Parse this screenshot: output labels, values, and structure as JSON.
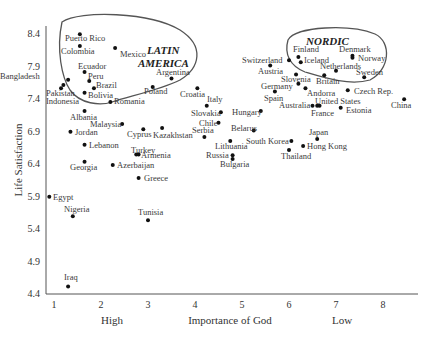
{
  "chart_data": {
    "type": "scatter",
    "title": "",
    "xlabel": "Importance of God",
    "ylabel": "Life Satisfaction",
    "x_end_labels": {
      "low_end": "High",
      "high_end": "Low"
    },
    "xlim": [
      0.9,
      8.6
    ],
    "ylim": [
      4.4,
      8.5
    ],
    "x_ticks": [
      1,
      2,
      3,
      4,
      5,
      6,
      7,
      8
    ],
    "y_ticks": [
      8.4,
      7.9,
      7.4,
      6.9,
      6.4,
      5.9,
      5.4,
      4.9,
      4.4
    ],
    "grid": false,
    "legend": null,
    "annotations": [
      {
        "text": "LATIN AMERICA",
        "type": "region-outline",
        "members": [
          "Puerto Rico",
          "Colombia",
          "Mexico",
          "Ecuador",
          "Peru",
          "Brazil",
          "Bolivia",
          "Argentina"
        ]
      },
      {
        "text": "NORDIC",
        "type": "region-outline",
        "members": [
          "Finland",
          "Iceland",
          "Denmark",
          "Norway",
          "Netherlands",
          "Sweden"
        ]
      }
    ],
    "points": [
      {
        "label": "Puerto Rico",
        "x": 1.55,
        "y": 8.38
      },
      {
        "label": "Colombia",
        "x": 1.55,
        "y": 8.2
      },
      {
        "label": "Mexico",
        "x": 2.3,
        "y": 8.17
      },
      {
        "label": "Ecuador",
        "x": 1.65,
        "y": 7.8
      },
      {
        "label": "Peru",
        "x": 1.75,
        "y": 7.66
      },
      {
        "label": "Brazil",
        "x": 1.85,
        "y": 7.55
      },
      {
        "label": "Bolivia",
        "x": 1.65,
        "y": 7.48
      },
      {
        "label": "Argentina",
        "x": 3.5,
        "y": 7.7
      },
      {
        "label": "Bangladesh",
        "x": 1.3,
        "y": 7.68
      },
      {
        "label": "Pakistan",
        "x": 1.15,
        "y": 7.55
      },
      {
        "label": "Indonesia",
        "x": 1.2,
        "y": 7.6
      },
      {
        "label": "Romania",
        "x": 2.2,
        "y": 7.34
      },
      {
        "label": "Poland",
        "x": 3.1,
        "y": 7.57
      },
      {
        "label": "Croatia",
        "x": 4.05,
        "y": 7.55
      },
      {
        "label": "Italy",
        "x": 4.25,
        "y": 7.28
      },
      {
        "label": "Albania",
        "x": 1.65,
        "y": 7.2
      },
      {
        "label": "Malaysia",
        "x": 2.45,
        "y": 7.0
      },
      {
        "label": "Jordan",
        "x": 1.35,
        "y": 6.88
      },
      {
        "label": "Cyprus",
        "x": 2.9,
        "y": 6.92
      },
      {
        "label": "Kazakhstan",
        "x": 3.3,
        "y": 6.94
      },
      {
        "label": "Lebanon",
        "x": 1.65,
        "y": 6.68
      },
      {
        "label": "Turkey",
        "x": 2.75,
        "y": 6.53
      },
      {
        "label": "Armenia",
        "x": 2.8,
        "y": 6.53
      },
      {
        "label": "Georgia",
        "x": 1.65,
        "y": 6.42
      },
      {
        "label": "Azerbaijan",
        "x": 2.25,
        "y": 6.37
      },
      {
        "label": "Greece",
        "x": 2.8,
        "y": 6.17
      },
      {
        "label": "Egypt",
        "x": 0.9,
        "y": 5.88
      },
      {
        "label": "Nigeria",
        "x": 1.4,
        "y": 5.58
      },
      {
        "label": "Tunisia",
        "x": 3.0,
        "y": 5.52
      },
      {
        "label": "Iraq",
        "x": 1.3,
        "y": 4.5
      },
      {
        "label": "Slovakia",
        "x": 4.55,
        "y": 7.18
      },
      {
        "label": "Hungary",
        "x": 5.4,
        "y": 7.2
      },
      {
        "label": "Chile",
        "x": 4.5,
        "y": 7.02
      },
      {
        "label": "Serbia",
        "x": 4.2,
        "y": 6.8
      },
      {
        "label": "Belarus",
        "x": 5.25,
        "y": 6.9
      },
      {
        "label": "Lithuania",
        "x": 4.75,
        "y": 6.74
      },
      {
        "label": "Russia",
        "x": 4.8,
        "y": 6.52
      },
      {
        "label": "Bulgaria",
        "x": 4.8,
        "y": 6.46
      },
      {
        "label": "South Korea",
        "x": 6.05,
        "y": 6.74
      },
      {
        "label": "Thailand",
        "x": 6.0,
        "y": 6.6
      },
      {
        "label": "Hong Kong",
        "x": 6.3,
        "y": 6.66
      },
      {
        "label": "Japan",
        "x": 6.6,
        "y": 6.77
      },
      {
        "label": "Switzerland",
        "x": 6.0,
        "y": 7.98
      },
      {
        "label": "Austria",
        "x": 5.6,
        "y": 7.9
      },
      {
        "label": "Finland",
        "x": 6.2,
        "y": 8.03
      },
      {
        "label": "Iceland",
        "x": 6.25,
        "y": 7.95
      },
      {
        "label": "Denmark",
        "x": 7.35,
        "y": 8.05
      },
      {
        "label": "Norway",
        "x": 7.35,
        "y": 8.02
      },
      {
        "label": "Netherlands",
        "x": 7.0,
        "y": 7.82
      },
      {
        "label": "Sweden",
        "x": 7.6,
        "y": 7.72
      },
      {
        "label": "Britain",
        "x": 6.75,
        "y": 7.75
      },
      {
        "label": "Slovenia",
        "x": 6.15,
        "y": 7.76
      },
      {
        "label": "Germany",
        "x": 6.2,
        "y": 7.62
      },
      {
        "label": "Andorra",
        "x": 6.35,
        "y": 7.55
      },
      {
        "label": "Spain",
        "x": 5.7,
        "y": 7.5
      },
      {
        "label": "Czech Rep.",
        "x": 7.25,
        "y": 7.52
      },
      {
        "label": "Australia",
        "x": 6.5,
        "y": 7.28
      },
      {
        "label": "United States",
        "x": 6.6,
        "y": 7.28
      },
      {
        "label": "France",
        "x": 6.65,
        "y": 7.28
      },
      {
        "label": "Estonia",
        "x": 7.1,
        "y": 7.25
      },
      {
        "label": "China",
        "x": 8.45,
        "y": 7.38
      }
    ]
  },
  "labels_layout": [
    {
      "t": "Puerto Rico",
      "x": 65,
      "y": 41
    },
    {
      "t": "Colombia",
      "x": 61,
      "y": 54
    },
    {
      "t": "Mexico",
      "x": 120,
      "y": 57
    },
    {
      "t": "Ecuador",
      "x": 78,
      "y": 69
    },
    {
      "t": "Peru",
      "x": 88,
      "y": 79
    },
    {
      "t": "Brazil",
      "x": 96,
      "y": 88
    },
    {
      "t": "Bolivia",
      "x": 88,
      "y": 98
    },
    {
      "t": "Argentina",
      "x": 156,
      "y": 75
    },
    {
      "t": "Bangladesh",
      "x": 0,
      "y": 79
    },
    {
      "t": "Pakistan",
      "x": 46,
      "y": 96
    },
    {
      "t": "Indonesia",
      "x": 46,
      "y": 104
    },
    {
      "t": "Romania",
      "x": 114,
      "y": 104
    },
    {
      "t": "Poland",
      "x": 144,
      "y": 94
    },
    {
      "t": "Croatia",
      "x": 180,
      "y": 97
    },
    {
      "t": "Italy",
      "x": 207,
      "y": 102
    },
    {
      "t": "Albania",
      "x": 70,
      "y": 120
    },
    {
      "t": "Malaysia",
      "x": 90,
      "y": 127
    },
    {
      "t": "Jordan",
      "x": 75,
      "y": 135
    },
    {
      "t": "Cyprus",
      "x": 127,
      "y": 137
    },
    {
      "t": "Kazakhstan",
      "x": 153,
      "y": 138
    },
    {
      "t": "Lebanon",
      "x": 89,
      "y": 148
    },
    {
      "t": "Turkey",
      "x": 131,
      "y": 153
    },
    {
      "t": "Armenia",
      "x": 141,
      "y": 158
    },
    {
      "t": "Georgia",
      "x": 70,
      "y": 170
    },
    {
      "t": "Azerbaijan",
      "x": 117,
      "y": 168
    },
    {
      "t": "Greece",
      "x": 144,
      "y": 181
    },
    {
      "t": "Egypt",
      "x": 53,
      "y": 200
    },
    {
      "t": "Nigeria",
      "x": 64,
      "y": 212
    },
    {
      "t": "Tunisia",
      "x": 138,
      "y": 215
    },
    {
      "t": "Iraq",
      "x": 64,
      "y": 280
    },
    {
      "t": "Slovakia",
      "x": 191,
      "y": 116
    },
    {
      "t": "Hungary",
      "x": 232,
      "y": 115
    },
    {
      "t": "Chile",
      "x": 199,
      "y": 126
    },
    {
      "t": "Serbia",
      "x": 192,
      "y": 133
    },
    {
      "t": "Belarus",
      "x": 231,
      "y": 131
    },
    {
      "t": "Lithuania",
      "x": 215,
      "y": 149
    },
    {
      "t": "Russia",
      "x": 206,
      "y": 158
    },
    {
      "t": "Bulgaria",
      "x": 220,
      "y": 167
    },
    {
      "t": "South Korea",
      "x": 246,
      "y": 144
    },
    {
      "t": "Thailand",
      "x": 281,
      "y": 159
    },
    {
      "t": "Hong Kong",
      "x": 307,
      "y": 149
    },
    {
      "t": "Japan",
      "x": 309,
      "y": 135
    },
    {
      "t": "Switzerland",
      "x": 242,
      "y": 63
    },
    {
      "t": "Austria",
      "x": 258,
      "y": 74
    },
    {
      "t": "Finland",
      "x": 293,
      "y": 52
    },
    {
      "t": "Iceland",
      "x": 304,
      "y": 63
    },
    {
      "t": "Denmark",
      "x": 339,
      "y": 52
    },
    {
      "t": "Norway",
      "x": 358,
      "y": 61
    },
    {
      "t": "Netherlands",
      "x": 320,
      "y": 69
    },
    {
      "t": "Sweden",
      "x": 356,
      "y": 75
    },
    {
      "t": "Britain",
      "x": 316,
      "y": 84
    },
    {
      "t": "Slovenia",
      "x": 281,
      "y": 82
    },
    {
      "t": "Germany",
      "x": 261,
      "y": 89
    },
    {
      "t": "Andorra",
      "x": 307,
      "y": 96
    },
    {
      "t": "Spain",
      "x": 264,
      "y": 101
    },
    {
      "t": "Czech Rep.",
      "x": 354,
      "y": 94
    },
    {
      "t": "Australia",
      "x": 279,
      "y": 108
    },
    {
      "t": "United States",
      "x": 315,
      "y": 104
    },
    {
      "t": "France",
      "x": 311,
      "y": 116
    },
    {
      "t": "Estonia",
      "x": 346,
      "y": 113
    },
    {
      "t": "China",
      "x": 391,
      "y": 108
    }
  ]
}
